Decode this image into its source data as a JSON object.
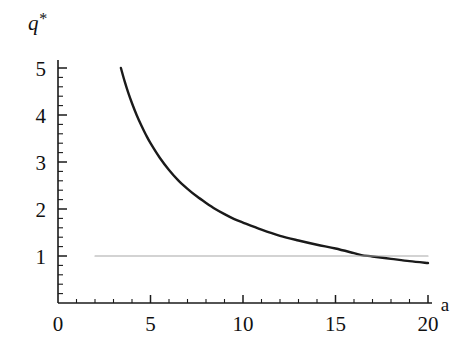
{
  "figure": {
    "background_color": "#ffffff",
    "curve_color": "#1a1a1a",
    "reference_line_color": "#a8a8a8",
    "axis_color": "#1a1a1a"
  },
  "chart_data": {
    "type": "line",
    "title": "",
    "subtitle": "",
    "xlabel": "a",
    "ylabel": "q*",
    "xlim": [
      0,
      20
    ],
    "ylim": [
      0,
      5.3
    ],
    "grid": false,
    "legend": null,
    "x_ticks": [
      0,
      5,
      10,
      15,
      20
    ],
    "x_tick_labels": [
      "0",
      "5",
      "10",
      "15",
      "20"
    ],
    "x_minor_tick_step": 1,
    "y_ticks": [
      1,
      2,
      3,
      4,
      5
    ],
    "y_tick_labels": [
      "1",
      "2",
      "3",
      "4",
      "5"
    ],
    "y_minor_tick_step": 0.2,
    "series": [
      {
        "name": "q*(a)",
        "style": "solid",
        "color": "#1a1a1a",
        "width": 2.4,
        "x": [
          3.4,
          3.6,
          3.8,
          4.0,
          4.25,
          4.5,
          4.75,
          5.0,
          5.5,
          6.0,
          6.5,
          7.0,
          7.5,
          8.0,
          8.5,
          9.0,
          9.5,
          10.0,
          11.0,
          12.0,
          13.0,
          14.0,
          15.0,
          16.0,
          16.4,
          17.0,
          18.0,
          19.0,
          20.0
        ],
        "y": [
          5.0,
          4.72,
          4.47,
          4.25,
          4.0,
          3.78,
          3.58,
          3.4,
          3.09,
          2.83,
          2.61,
          2.43,
          2.27,
          2.13,
          2.0,
          1.89,
          1.79,
          1.71,
          1.56,
          1.43,
          1.33,
          1.24,
          1.16,
          1.06,
          1.02,
          0.99,
          0.94,
          0.89,
          0.85
        ]
      },
      {
        "name": "q* = 1 reference",
        "style": "solid",
        "color": "#a8a8a8",
        "width": 1.2,
        "x": [
          2.0,
          20.0
        ],
        "y": [
          1.0,
          1.0
        ]
      }
    ],
    "annotations": []
  }
}
